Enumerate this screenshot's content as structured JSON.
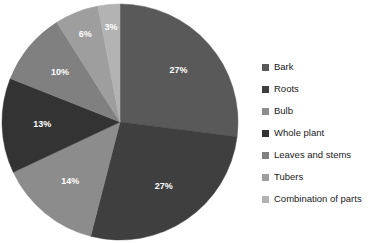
{
  "chart_data": {
    "type": "pie",
    "title": "",
    "xlabel": "",
    "ylabel": "",
    "legend_position": "right",
    "grid": false,
    "start_angle_deg": 0,
    "direction": "clockwise",
    "units": "percent",
    "categories": [
      "Bark",
      "Roots",
      "Bulb",
      "Whole plant",
      "Leaves and stems",
      "Tubers",
      "Combination of parts"
    ],
    "values": [
      27,
      27,
      14,
      13,
      10,
      6,
      3
    ],
    "labels": [
      "27%",
      "27%",
      "14%",
      "13%",
      "10%",
      "6%",
      "3%"
    ],
    "colors": [
      "#595959",
      "#3f3f3f",
      "#8c8c8c",
      "#333333",
      "#808080",
      "#9e9e9e",
      "#b3b3b3"
    ],
    "slices": [
      {
        "name": "Bark",
        "value": 27,
        "label": "27%",
        "color": "#595959"
      },
      {
        "name": "Roots",
        "value": 27,
        "label": "27%",
        "color": "#3f3f3f"
      },
      {
        "name": "Bulb",
        "value": 14,
        "label": "14%",
        "color": "#8c8c8c"
      },
      {
        "name": "Whole plant",
        "value": 13,
        "label": "13%",
        "color": "#333333"
      },
      {
        "name": "Leaves and stems",
        "value": 10,
        "label": "10%",
        "color": "#808080"
      },
      {
        "name": "Tubers",
        "value": 6,
        "label": "6%",
        "color": "#9e9e9e"
      },
      {
        "name": "Combination of parts",
        "value": 3,
        "label": "3%",
        "color": "#b3b3b3"
      }
    ]
  },
  "geometry": {
    "center_x": 120,
    "center_y": 122,
    "radius": 118,
    "label_radius_ratio": 0.66
  },
  "legend": {
    "items": [
      {
        "label": "Bark",
        "color": "#595959"
      },
      {
        "label": "Roots",
        "color": "#3f3f3f"
      },
      {
        "label": "Bulb",
        "color": "#8c8c8c"
      },
      {
        "label": "Whole plant",
        "color": "#333333"
      },
      {
        "label": "Leaves and stems",
        "color": "#808080"
      },
      {
        "label": "Tubers",
        "color": "#9e9e9e"
      },
      {
        "label": "Combination of parts",
        "color": "#b3b3b3"
      }
    ]
  }
}
